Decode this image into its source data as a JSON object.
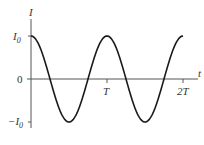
{
  "chart_data": {
    "type": "line",
    "title": "",
    "xlabel": "t",
    "ylabel": "I",
    "x_ticks": [
      "T",
      "2T"
    ],
    "y_ticks": [
      "I0",
      "0",
      "-I0"
    ],
    "function": "I = I0 cos(2πt/T)",
    "x": [
      0,
      0.25,
      0.5,
      0.75,
      1.0,
      1.25,
      1.5,
      1.75,
      2.0
    ],
    "series": [
      {
        "name": "I(t)",
        "values": [
          1,
          0,
          -1,
          0,
          1,
          0,
          -1,
          0,
          1
        ]
      }
    ],
    "xlim": [
      0,
      2
    ],
    "ylim": [
      -1,
      1
    ],
    "grid": false,
    "colors": {
      "curve": "#1a1a1a",
      "axes": "#555555"
    }
  },
  "labels": {
    "y_axis": "I",
    "x_axis": "t",
    "i0_base": "I",
    "i0_sub": "0",
    "neg_i0_prefix": "−I",
    "neg_i0_sub": "0",
    "zero": "0",
    "tick_T": "T",
    "tick_2T": "2T"
  }
}
